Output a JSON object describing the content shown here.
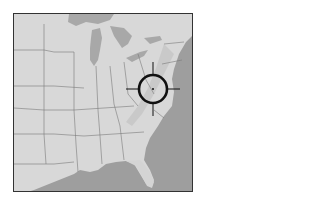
{
  "map": {
    "region": "Eastern United States",
    "style": "grayscale shaded relief",
    "colors": {
      "land": "#d9d9d9",
      "land_shadow": "#c4c4c4",
      "water": "#9e9e9e",
      "lakes": "#a8a8a8",
      "borders": "#7a7a7a",
      "frame": "#333333",
      "marker": "#111111"
    }
  },
  "marker": {
    "type": "crosshair",
    "center_x": 153,
    "center_y": 89,
    "radius": 14
  }
}
